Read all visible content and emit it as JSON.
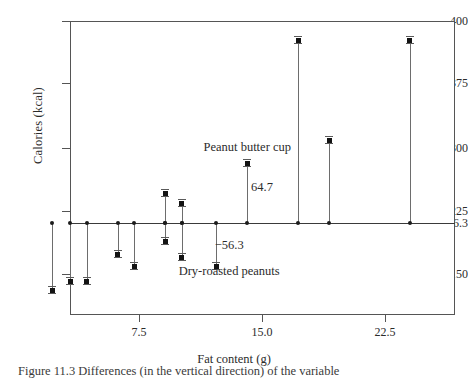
{
  "chart_data": {
    "type": "scatter",
    "title": "",
    "xlabel": "Fat content (g)",
    "ylabel": "Calories (kcal)",
    "xlim": [
      1.5,
      25.0
    ],
    "ylim": [
      117,
      400
    ],
    "grid": false,
    "legend_position": "none",
    "baseline": {
      "value": 216.3,
      "label": "216.3",
      "description": "mean calories reference line"
    },
    "x_ticks": [
      {
        "label": "7.5",
        "value": 7.5
      },
      {
        "label": "15.0",
        "value": 15.0
      },
      {
        "label": "22.5",
        "value": 22.5
      }
    ],
    "y_ticks": [
      {
        "label": "400",
        "value": 400
      },
      {
        "label": "375",
        "value": 375
      },
      {
        "label": "300",
        "value": 300
      },
      {
        "label": "225",
        "value": 225
      },
      {
        "label": "216.3",
        "value": 216.3
      },
      {
        "label": "150",
        "value": 150
      }
    ],
    "series": [
      {
        "name": "Calories vs fat content (deviations from mean)",
        "points": [
          {
            "x": 2.2,
            "y": 128,
            "name": "point-1"
          },
          {
            "x": 3.3,
            "y": 140,
            "name": "point-2"
          },
          {
            "x": 4.3,
            "y": 140,
            "name": "point-3"
          },
          {
            "x": 6.2,
            "y": 175,
            "name": "point-4"
          },
          {
            "x": 7.2,
            "y": 160,
            "name": "point-5"
          },
          {
            "x": 9.1,
            "y": 246,
            "name": "point-6-high"
          },
          {
            "x": 9.1,
            "y": 192,
            "name": "point-6-low"
          },
          {
            "x": 10.1,
            "y": 234,
            "name": "point-7-high"
          },
          {
            "x": 10.1,
            "y": 172,
            "name": "point-7-low"
          },
          {
            "x": 12.2,
            "y": 160,
            "name": "point-8-dry-roasted-peanuts"
          },
          {
            "x": 14.1,
            "y": 281,
            "name": "point-9-peanut-butter-cup"
          },
          {
            "x": 17.2,
            "y": 392,
            "name": "point-10"
          },
          {
            "x": 19.1,
            "y": 309,
            "name": "point-11"
          },
          {
            "x": 24.0,
            "y": 392,
            "name": "point-12"
          }
        ]
      }
    ],
    "annotations": [
      {
        "text": "Peanut butter cup",
        "x": 14.1,
        "y": 300,
        "name": "annotation-peanut-butter-cup"
      },
      {
        "text": "64.7",
        "x": 15.0,
        "y": 252,
        "name": "annotation-positive-residual"
      },
      {
        "text": "−56.3",
        "x": 13.0,
        "y": 186,
        "name": "annotation-negative-residual"
      },
      {
        "text": "Dry-roasted peanuts",
        "x": 13.0,
        "y": 152,
        "name": "annotation-dry-roasted-peanuts"
      }
    ]
  },
  "figure": {
    "caption": "Figure 11.3  Differences (in the vertical direction) of the variable"
  },
  "colors": {
    "background": "#ffffff",
    "axis": "#555555",
    "baseline": "#3a3a3a",
    "stem": "#6d6d6d",
    "marker": "#131313",
    "text": "#2b2b2b"
  }
}
